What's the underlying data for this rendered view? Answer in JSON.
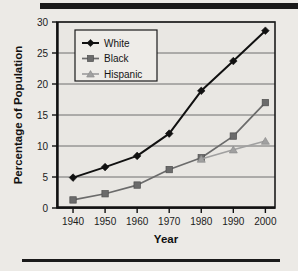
{
  "figure": {
    "background_color": "#eceae6",
    "plot_background_color": "#e9e7e3",
    "frame_color": "#1c1c1c",
    "gridline_color": "#6f6f6f",
    "top_rule": "top-rule",
    "bottom_rule": "bottom-rule"
  },
  "chart_data": {
    "type": "line",
    "title": "",
    "xlabel": "Year",
    "ylabel": "Percentage of Population",
    "x": [
      1940,
      1950,
      1960,
      1970,
      1980,
      1990,
      2000
    ],
    "xtick_labels": [
      "1940",
      "1950",
      "1960",
      "1970",
      "1980",
      "1990",
      "2000"
    ],
    "ytick_labels": [
      "0",
      "5",
      "10",
      "15",
      "20",
      "25",
      "30"
    ],
    "yticks": [
      0,
      5,
      10,
      15,
      20,
      25,
      30
    ],
    "xlim": [
      1935,
      2003
    ],
    "ylim": [
      0,
      30
    ],
    "grid": "horizontal",
    "legend_position": "upper-left-inside",
    "series": [
      {
        "name": "White",
        "color": "#111111",
        "marker": "diamond",
        "values": [
          4.9,
          6.6,
          8.4,
          12.0,
          18.9,
          23.7,
          28.6
        ]
      },
      {
        "name": "Black",
        "color": "#6b6b6b",
        "marker": "square",
        "values": [
          1.3,
          2.3,
          3.7,
          6.2,
          8.1,
          11.6,
          17.0
        ]
      },
      {
        "name": "Hispanic",
        "color": "#a0a0a0",
        "marker": "triangle",
        "values": [
          null,
          null,
          null,
          null,
          7.9,
          9.4,
          10.8
        ]
      }
    ]
  },
  "legend": {
    "entries": [
      {
        "label": "White"
      },
      {
        "label": "Black"
      },
      {
        "label": "Hispanic"
      }
    ]
  }
}
